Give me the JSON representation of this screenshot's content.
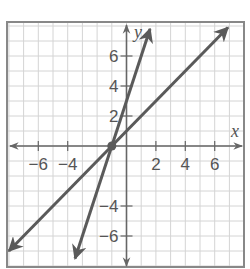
{
  "chart_data": {
    "type": "line",
    "title": "",
    "xlabel": "x",
    "ylabel": "y",
    "xlim": [
      -8,
      8
    ],
    "ylim": [
      -8,
      8
    ],
    "grid": true,
    "grid_step": 1,
    "x_ticks": [
      -6,
      -4,
      2,
      4,
      6
    ],
    "x_tick_labels": [
      "−6",
      "−4",
      "2",
      "4",
      "6"
    ],
    "y_ticks": [
      6,
      4,
      2,
      -4,
      -6
    ],
    "y_tick_labels": [
      "6",
      "4",
      "2",
      "−4",
      "−6"
    ],
    "series": [
      {
        "name": "steep line",
        "equation": "y = 3x + 3",
        "slope": 3,
        "intercept": 3,
        "x": [
          -3.5,
          1.6
        ],
        "y": [
          -7.5,
          7.8
        ]
      },
      {
        "name": "shallow line",
        "equation": "y = x + 1",
        "slope": 1,
        "intercept": 1,
        "x": [
          -8,
          6.9
        ],
        "y": [
          -7,
          7.9
        ]
      }
    ],
    "points": [
      {
        "label": "intersection",
        "x": -1,
        "y": 0
      }
    ]
  },
  "colors": {
    "grid": "#d4d4d4",
    "border": "#888888",
    "axis": "#666666",
    "line": "#5a5a5a",
    "text": "#555555"
  }
}
